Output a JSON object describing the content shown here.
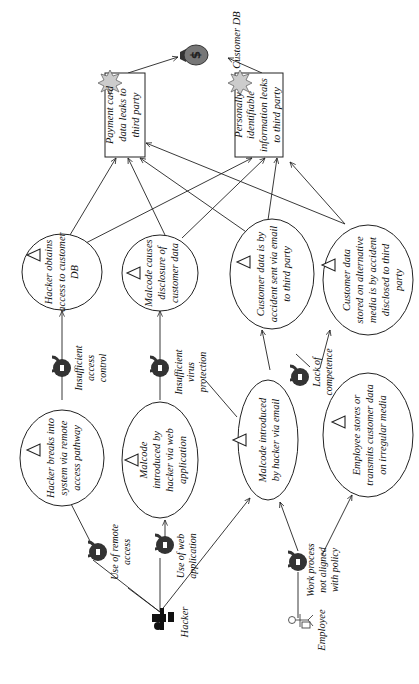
{
  "diagram": {
    "orientation": "rotated-90-ccw",
    "asset": {
      "label": "Customer DB",
      "icon": "money-bag-icon"
    },
    "unwanted_incidents": [
      {
        "id": "payment",
        "lines": [
          "Payment card",
          "data leaks to",
          "third party"
        ]
      },
      {
        "id": "pii",
        "lines": [
          "Personally",
          "identifiable",
          "information leaks",
          "to third party"
        ]
      }
    ],
    "threat_scenarios": [
      {
        "id": "ts1",
        "lines": [
          "Hacker breaks into",
          "system via remote",
          "access pathway"
        ]
      },
      {
        "id": "ts2",
        "lines": [
          "Hacker obtains",
          "access to customer",
          "DB"
        ]
      },
      {
        "id": "ts3",
        "lines": [
          "Malcode",
          "introduced by",
          "hacker via web",
          "application"
        ]
      },
      {
        "id": "ts4",
        "lines": [
          "Malcode causes",
          "disclosure of",
          "customer data"
        ]
      },
      {
        "id": "ts5",
        "lines": [
          "Malcode introduced",
          "by hacker via email"
        ]
      },
      {
        "id": "ts6",
        "lines": [
          "Customer data is by",
          "accident sent via email",
          "to third party"
        ]
      },
      {
        "id": "ts7",
        "lines": [
          "Employee stores or",
          "transmits customer data",
          "on irregular media"
        ]
      },
      {
        "id": "ts8",
        "lines": [
          "Customer data",
          "stored on alternative",
          "media is by accident",
          "disclosed to third",
          "party"
        ]
      }
    ],
    "vulnerabilities": [
      {
        "id": "v1",
        "lines": [
          "Use of remote",
          "access"
        ]
      },
      {
        "id": "v2",
        "lines": [
          "Insufficient",
          "access",
          "control"
        ]
      },
      {
        "id": "v3",
        "lines": [
          "Use of web",
          "application"
        ]
      },
      {
        "id": "v4",
        "lines": [
          "Insufficient",
          "virus",
          "protection"
        ]
      },
      {
        "id": "v5",
        "lines": [
          "Lack of",
          "competence"
        ]
      },
      {
        "id": "v6",
        "lines": [
          "Work process",
          "not aligned",
          "with policy"
        ]
      }
    ],
    "threats": [
      {
        "id": "hacker",
        "label": "Hacker",
        "icon": "hacker-icon"
      },
      {
        "id": "employee",
        "label": "Employee",
        "icon": "employee-icon"
      }
    ],
    "colors": {
      "line": "#222222",
      "lock": "#333333",
      "bag": "#777777",
      "burst": "#cccccc"
    }
  }
}
